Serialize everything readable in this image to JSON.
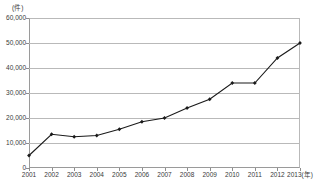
{
  "chart_data": {
    "type": "line",
    "title": "",
    "subtitle": "",
    "xlabel": "2013(年)",
    "ylabel": "(件)",
    "unit_label": "(件)",
    "categories": [
      "2001",
      "2002",
      "2003",
      "2004",
      "2005",
      "2006",
      "2007",
      "2008",
      "2009",
      "2010",
      "2011",
      "2012",
      "2013"
    ],
    "x_tick_labels": [
      "2001",
      "2002",
      "2003",
      "2004",
      "2005",
      "2006",
      "2007",
      "2008",
      "2009",
      "2010",
      "2011",
      "2012",
      "2013(年)"
    ],
    "values": [
      5000,
      13500,
      12500,
      13000,
      15500,
      18500,
      20000,
      24000,
      27500,
      34000,
      34000,
      44000,
      50000
    ],
    "series": [
      {
        "name": "件数",
        "values": [
          5000,
          13500,
          12500,
          13000,
          15500,
          18500,
          20000,
          24000,
          27500,
          34000,
          34000,
          44000,
          50000
        ]
      }
    ],
    "ylim": [
      0,
      60000
    ],
    "y_tick_values": [
      0,
      10000,
      20000,
      30000,
      40000,
      50000,
      60000
    ],
    "y_tick_labels": [
      "0",
      "10,000",
      "20,000",
      "30,000",
      "40,000",
      "50,000",
      "60,000"
    ],
    "grid": true,
    "grid_axis": "y",
    "legend": false,
    "legend_position": "none",
    "marker": "diamond",
    "line_color": "#1a1a1a",
    "marker_color": "#1a1a1a",
    "grid_color": "#b9b9b9",
    "axis_color": "#9a9a9a",
    "text_color": "#3a3a3a",
    "background_color": "#ffffff"
  }
}
